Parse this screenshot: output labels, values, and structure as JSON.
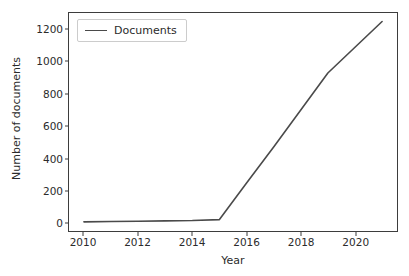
{
  "chart_data": {
    "type": "line",
    "title": "",
    "xlabel": "Year",
    "ylabel": "Number of documents",
    "xlim": [
      2009.45,
      2021.55
    ],
    "ylim": [
      -53,
      1303
    ],
    "grid": false,
    "legend_position": "upper left",
    "x": [
      2010,
      2011,
      2012,
      2013,
      2014,
      2015,
      2016,
      2017,
      2018,
      2019,
      2020,
      2021
    ],
    "xticks": [
      2010,
      2012,
      2014,
      2016,
      2018,
      2020
    ],
    "xticklabels": [
      "2010",
      "2012",
      "2014",
      "2016",
      "2018",
      "2020"
    ],
    "yticks": [
      0,
      200,
      400,
      600,
      800,
      1000,
      1200
    ],
    "yticklabels": [
      "0",
      "200",
      "400",
      "600",
      "800",
      "1000",
      "1200"
    ],
    "series": [
      {
        "name": "Documents",
        "color": "#4a4a4a",
        "linewidth": 1.6,
        "values": [
          4,
          6,
          8,
          10,
          12,
          18,
          245,
          470,
          700,
          930,
          1090,
          1250
        ]
      }
    ]
  },
  "legend": {
    "entries": [
      {
        "label": "Documents",
        "color": "#4a4a4a"
      }
    ]
  },
  "axes": {
    "frame_color": "#3d3d3d",
    "background": "#ffffff"
  }
}
